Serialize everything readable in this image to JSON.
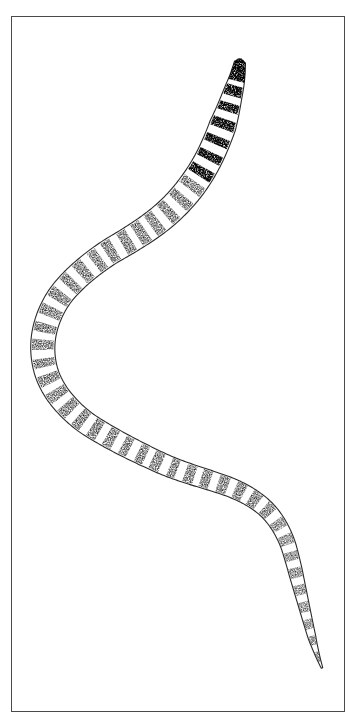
{
  "figure": {
    "kind": "scientific-line-drawing",
    "subject_label": "nematode larva",
    "caption": "",
    "background_color": "#ffffff",
    "frame": {
      "visible": true,
      "color": "#4a4a4a",
      "stroke_width": 1,
      "x": 11,
      "y": 16,
      "width": 334,
      "height": 696
    },
    "drawing": {
      "outline_color": "#2b2b2b",
      "outline_width": 1.1,
      "fill_color": "#ffffff",
      "stipple_color": "#1a1a1a",
      "head_cap_color": "#141414",
      "orientation": "head-upper-right, tail-lower-right",
      "body_shape": "sigmoid S-curve",
      "segment_count": 46,
      "head": {
        "tip_x": 241,
        "tip_y": 57,
        "cap_label": "dark-cephalic-cap"
      },
      "tail": {
        "tip_x": 322,
        "tip_y": 668,
        "label": "pointed-caudal-tip"
      },
      "spine_points": [
        [
          240,
          62
        ],
        [
          237,
          78
        ],
        [
          232,
          96
        ],
        [
          226,
          116
        ],
        [
          218,
          138
        ],
        [
          208,
          160
        ],
        [
          196,
          180
        ],
        [
          182,
          198
        ],
        [
          166,
          214
        ],
        [
          148,
          228
        ],
        [
          128,
          241
        ],
        [
          108,
          253
        ],
        [
          90,
          266
        ],
        [
          74,
          280
        ],
        [
          60,
          296
        ],
        [
          50,
          314
        ],
        [
          44,
          334
        ],
        [
          43,
          354
        ],
        [
          47,
          374
        ],
        [
          56,
          392
        ],
        [
          69,
          408
        ],
        [
          85,
          422
        ],
        [
          104,
          434
        ],
        [
          124,
          445
        ],
        [
          146,
          456
        ],
        [
          168,
          466
        ],
        [
          190,
          474
        ],
        [
          212,
          481
        ],
        [
          232,
          488
        ],
        [
          250,
          497
        ],
        [
          266,
          509
        ],
        [
          278,
          524
        ],
        [
          287,
          542
        ],
        [
          293,
          562
        ],
        [
          298,
          582
        ],
        [
          303,
          602
        ],
        [
          308,
          622
        ],
        [
          313,
          641
        ],
        [
          318,
          657
        ],
        [
          322,
          668
        ]
      ],
      "width_profile": [
        {
          "t": 0.0,
          "half_width": 5.5
        },
        {
          "t": 0.03,
          "half_width": 9.0
        },
        {
          "t": 0.08,
          "half_width": 13.5
        },
        {
          "t": 0.16,
          "half_width": 14.0
        },
        {
          "t": 0.3,
          "half_width": 13.0
        },
        {
          "t": 0.45,
          "half_width": 12.0
        },
        {
          "t": 0.6,
          "half_width": 11.0
        },
        {
          "t": 0.75,
          "half_width": 9.5
        },
        {
          "t": 0.88,
          "half_width": 7.0
        },
        {
          "t": 0.96,
          "half_width": 4.0
        },
        {
          "t": 1.0,
          "half_width": 0.8
        }
      ]
    }
  }
}
